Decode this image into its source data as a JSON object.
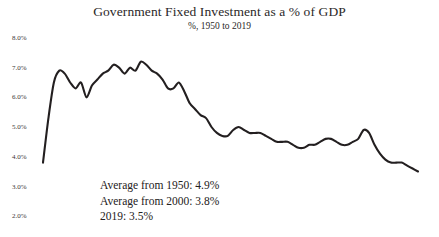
{
  "chart_data": {
    "type": "line",
    "title": "Government Fixed Investment as a % of GDP",
    "subtitle": "%, 1950 to 2019",
    "xlabel": "",
    "ylabel": "",
    "ylim": [
      2.0,
      8.0
    ],
    "xlim": [
      1950,
      2019
    ],
    "grid": false,
    "legend": "none",
    "ytick_labels": [
      "8.0%",
      "7.0%",
      "6.0%",
      "5.0%",
      "4.0%",
      "3.0%",
      "2.0%"
    ],
    "ytick_values": [
      8.0,
      7.0,
      6.0,
      5.0,
      4.0,
      3.0,
      2.0
    ],
    "xtick_labels": [],
    "line_color": "#231f20",
    "series": [
      {
        "name": "Government Fixed Investment as a % of GDP",
        "x": [
          1950,
          1951,
          1952,
          1953,
          1954,
          1955,
          1956,
          1957,
          1958,
          1959,
          1960,
          1961,
          1962,
          1963,
          1964,
          1965,
          1966,
          1967,
          1968,
          1969,
          1970,
          1971,
          1972,
          1973,
          1974,
          1975,
          1976,
          1977,
          1978,
          1979,
          1980,
          1981,
          1982,
          1983,
          1984,
          1985,
          1986,
          1987,
          1988,
          1989,
          1990,
          1991,
          1992,
          1993,
          1994,
          1995,
          1996,
          1997,
          1998,
          1999,
          2000,
          2001,
          2002,
          2003,
          2004,
          2005,
          2006,
          2007,
          2008,
          2009,
          2010,
          2011,
          2012,
          2013,
          2014,
          2015,
          2016,
          2017,
          2018,
          2019
        ],
        "values": [
          3.8,
          5.3,
          6.5,
          6.9,
          6.8,
          6.5,
          6.3,
          6.5,
          6.0,
          6.4,
          6.6,
          6.8,
          6.9,
          7.1,
          7.0,
          6.8,
          7.0,
          6.9,
          7.2,
          7.1,
          6.9,
          6.8,
          6.6,
          6.3,
          6.3,
          6.5,
          6.2,
          5.8,
          5.6,
          5.4,
          5.3,
          5.0,
          4.8,
          4.7,
          4.7,
          4.9,
          5.0,
          4.9,
          4.8,
          4.8,
          4.8,
          4.7,
          4.6,
          4.5,
          4.5,
          4.5,
          4.4,
          4.3,
          4.3,
          4.4,
          4.4,
          4.5,
          4.6,
          4.6,
          4.5,
          4.4,
          4.4,
          4.5,
          4.6,
          4.9,
          4.8,
          4.4,
          4.1,
          3.9,
          3.8,
          3.8,
          3.8,
          3.7,
          3.6,
          3.5
        ]
      }
    ],
    "annotations": [
      "Average from 1950: 4.9%",
      "Average from 2000: 3.8%",
      "2019: 3.5%"
    ],
    "annotation_values": {
      "average_from_1950": 4.9,
      "average_from_2000": 3.8,
      "value_2019": 3.5
    }
  },
  "axis": {
    "ticks": [
      {
        "label": "8.0%",
        "top": 34
      },
      {
        "label": "7.0%",
        "top": 64
      },
      {
        "label": "6.0%",
        "top": 93
      },
      {
        "label": "5.0%",
        "top": 123
      },
      {
        "label": "4.0%",
        "top": 153
      },
      {
        "label": "3.0%",
        "top": 183
      },
      {
        "label": "2.0%",
        "top": 212
      }
    ]
  }
}
